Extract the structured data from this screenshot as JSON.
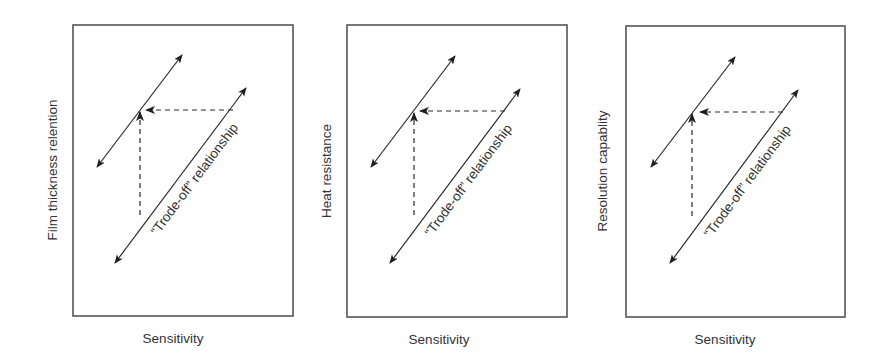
{
  "diagram": {
    "panels": [
      {
        "id": "film-thickness-retention",
        "y_label": "Film thickness relention",
        "x_label": "Sensitivity",
        "tradeoff_label": "“Trode-off” relationship",
        "frame": {
          "x": 73,
          "y": 25,
          "w": 220,
          "h": 291
        },
        "upper_line": {
          "x1": 97,
          "y1": 167,
          "x2": 182,
          "y2": 55
        },
        "lower_line": {
          "x1": 115,
          "y1": 263,
          "x2": 246,
          "y2": 88
        },
        "h_dash": {
          "x1": 233,
          "y1": 110,
          "x2": 146,
          "y2": 110
        },
        "v_dash": {
          "x1": 140,
          "y1": 215,
          "x2": 140,
          "y2": 112
        },
        "y_label_pos": {
          "x": 57,
          "y": 170
        },
        "x_label_pos": {
          "x": 173,
          "y": 343
        },
        "tradeoff_pos": {
          "x": 198,
          "y": 182
        }
      },
      {
        "id": "heat-resistance",
        "y_label": "Heat resistance",
        "x_label": "Sensitivity",
        "tradeoff_label": "“Trode-off” relationship",
        "frame": {
          "x": 347,
          "y": 25,
          "w": 220,
          "h": 292
        },
        "upper_line": {
          "x1": 371,
          "y1": 167,
          "x2": 455,
          "y2": 56
        },
        "lower_line": {
          "x1": 390,
          "y1": 263,
          "x2": 520,
          "y2": 89
        },
        "h_dash": {
          "x1": 505,
          "y1": 111,
          "x2": 420,
          "y2": 111
        },
        "v_dash": {
          "x1": 414,
          "y1": 215,
          "x2": 414,
          "y2": 113
        },
        "y_label_pos": {
          "x": 331,
          "y": 171
        },
        "x_label_pos": {
          "x": 439,
          "y": 344
        },
        "tradeoff_pos": {
          "x": 472,
          "y": 183
        }
      },
      {
        "id": "resolution-capability",
        "y_label": "Resolution capablity",
        "x_label": "Sensitivity",
        "tradeoff_label": "“Trode-off” relationship",
        "frame": {
          "x": 626,
          "y": 26,
          "w": 219,
          "h": 291
        },
        "upper_line": {
          "x1": 651,
          "y1": 167,
          "x2": 735,
          "y2": 57
        },
        "lower_line": {
          "x1": 670,
          "y1": 263,
          "x2": 798,
          "y2": 90
        },
        "h_dash": {
          "x1": 783,
          "y1": 112,
          "x2": 700,
          "y2": 112
        },
        "v_dash": {
          "x1": 692,
          "y1": 216,
          "x2": 692,
          "y2": 114
        },
        "y_label_pos": {
          "x": 607,
          "y": 171
        },
        "x_label_pos": {
          "x": 725,
          "y": 344
        },
        "tradeoff_pos": {
          "x": 751,
          "y": 184
        }
      }
    ],
    "colors": {
      "frame": "#555555",
      "line": "#2a2a2a",
      "text": "#333333",
      "background": "#ffffff"
    }
  }
}
